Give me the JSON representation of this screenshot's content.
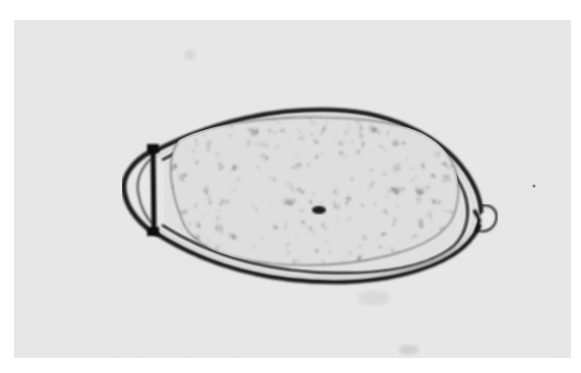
{
  "image": {
    "kind": "micrograph",
    "subject": "operculated helminth egg",
    "tone": "grayscale",
    "colors": {
      "border": "#ffffff",
      "background": "#e6e6e6",
      "shell_dark": "#1a1a1a",
      "shell_gap": "#d4d4d4",
      "interior_light": "#e2e2e2",
      "granule_dark": "#6a6a6a"
    },
    "features": [
      {
        "name": "operculum",
        "position": "left pole"
      },
      {
        "name": "shell",
        "description": "thick double-walled oval outline"
      },
      {
        "name": "granular contents",
        "description": "mottled yolk cells filling interior"
      },
      {
        "name": "abopercular knob",
        "position": "right pole"
      }
    ]
  }
}
